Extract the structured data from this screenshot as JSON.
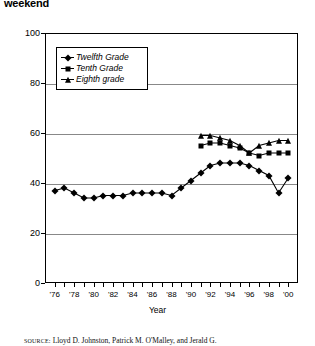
{
  "title": "weekend",
  "axis": {
    "x_title": "Year",
    "y_ticks": [
      "0",
      "20",
      "40",
      "60",
      "80",
      "100"
    ],
    "x_ticks": [
      "'76",
      "'78",
      "'80",
      "'82",
      "'84",
      "'86",
      "'88",
      "'90",
      "'92",
      "'94",
      "'96",
      "'98",
      "'00"
    ]
  },
  "legend": {
    "items": [
      {
        "label": "Twelfth Grade",
        "marker": "diamond-marker"
      },
      {
        "label": "Tenth Grade",
        "marker": "square-marker"
      },
      {
        "label": "Eighth grade",
        "marker": "triangle-marker"
      }
    ]
  },
  "source": "SOURCE: Lloyd D. Johnston, Patrick M. O'Malley, and Jerald G.",
  "chart_data": {
    "type": "line",
    "title": "weekend",
    "xlabel": "Year",
    "ylabel": "",
    "xlim": [
      1975,
      2001
    ],
    "ylim": [
      0,
      100
    ],
    "grid": true,
    "legend_position": "top-left-inside",
    "x": [
      1976,
      1977,
      1978,
      1979,
      1980,
      1981,
      1982,
      1983,
      1984,
      1985,
      1986,
      1987,
      1988,
      1989,
      1990,
      1991,
      1992,
      1993,
      1994,
      1995,
      1996,
      1997,
      1998,
      1999,
      2000
    ],
    "series": [
      {
        "name": "Twelfth Grade",
        "marker": "diamond",
        "x": [
          1976,
          1977,
          1978,
          1979,
          1980,
          1981,
          1982,
          1983,
          1984,
          1985,
          1986,
          1987,
          1988,
          1989,
          1990,
          1991,
          1992,
          1993,
          1994,
          1995,
          1996,
          1997,
          1998,
          1999,
          2000
        ],
        "values": [
          37,
          38,
          36,
          34,
          34,
          35,
          35,
          35,
          36,
          36,
          36,
          36,
          35,
          38,
          41,
          44,
          47,
          48,
          48,
          48,
          47,
          45,
          43,
          36,
          42
        ]
      },
      {
        "name": "Tenth Grade",
        "marker": "square",
        "x": [
          1991,
          1992,
          1993,
          1994,
          1995,
          1996,
          1997,
          1998,
          1999,
          2000
        ],
        "values": [
          55,
          56,
          56,
          55,
          54,
          52,
          51,
          52,
          52,
          52
        ]
      },
      {
        "name": "Eighth grade",
        "marker": "triangle",
        "x": [
          1991,
          1992,
          1993,
          1994,
          1995,
          1996,
          1997,
          1998,
          1999,
          2000
        ],
        "values": [
          59,
          59,
          58,
          57,
          55,
          52,
          55,
          56,
          57,
          57
        ]
      }
    ]
  }
}
